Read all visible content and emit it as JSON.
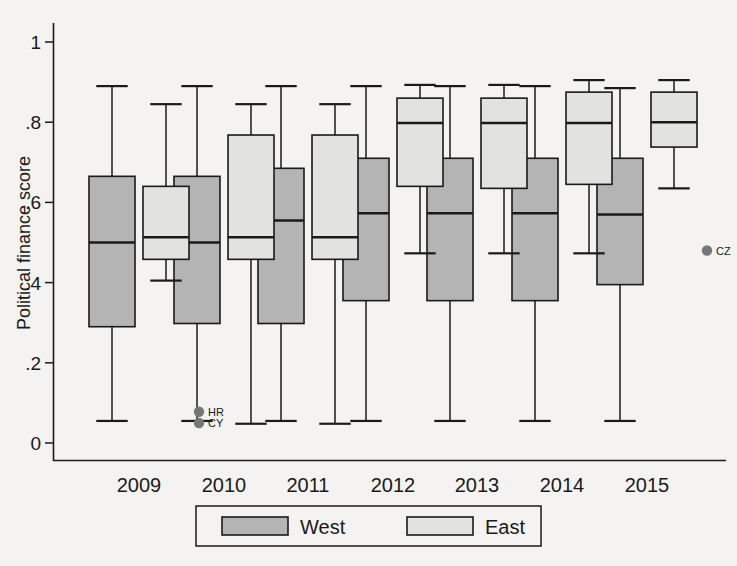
{
  "chart_data": {
    "type": "box",
    "title": "",
    "xlabel": "",
    "ylabel": "Political finance score",
    "categories": [
      "2009",
      "2010",
      "2011",
      "2012",
      "2013",
      "2014",
      "2015"
    ],
    "ylim": [
      0,
      1
    ],
    "yticks": [
      0,
      0.2,
      0.4,
      0.6,
      0.8,
      1
    ],
    "ytick_labels": [
      "0",
      ".2",
      ".4",
      ".6",
      ".8",
      "1"
    ],
    "grid": false,
    "legend_position": "bottom",
    "series": [
      {
        "name": "West",
        "color": "#b4b4b4",
        "boxes": [
          {
            "category": "2009",
            "min": 0.055,
            "q1": 0.29,
            "median": 0.5,
            "q3": 0.665,
            "max": 0.89,
            "outliers": []
          },
          {
            "category": "2010",
            "min": 0.055,
            "q1": 0.298,
            "median": 0.5,
            "q3": 0.665,
            "max": 0.89,
            "outliers": []
          },
          {
            "category": "2011",
            "min": 0.055,
            "q1": 0.298,
            "median": 0.555,
            "q3": 0.685,
            "max": 0.89,
            "outliers": []
          },
          {
            "category": "2012",
            "min": 0.055,
            "q1": 0.355,
            "median": 0.573,
            "q3": 0.71,
            "max": 0.89,
            "outliers": []
          },
          {
            "category": "2013",
            "min": 0.055,
            "q1": 0.355,
            "median": 0.573,
            "q3": 0.71,
            "max": 0.89,
            "outliers": []
          },
          {
            "category": "2014",
            "min": 0.055,
            "q1": 0.355,
            "median": 0.573,
            "q3": 0.71,
            "max": 0.89,
            "outliers": []
          },
          {
            "category": "2015",
            "min": 0.055,
            "q1": 0.395,
            "median": 0.57,
            "q3": 0.71,
            "max": 0.885,
            "outliers": []
          }
        ]
      },
      {
        "name": "East",
        "color": "#e2e2e0",
        "boxes": [
          {
            "category": "2009",
            "min": 0.405,
            "q1": 0.458,
            "median": 0.513,
            "q3": 0.64,
            "max": 0.845,
            "outliers": [
              {
                "label": "HR",
                "value": 0.078
              },
              {
                "label": "CY",
                "value": 0.05
              }
            ]
          },
          {
            "category": "2010",
            "min": 0.048,
            "q1": 0.458,
            "median": 0.513,
            "q3": 0.768,
            "max": 0.845,
            "outliers": []
          },
          {
            "category": "2011",
            "min": 0.048,
            "q1": 0.458,
            "median": 0.513,
            "q3": 0.768,
            "max": 0.845,
            "outliers": []
          },
          {
            "category": "2012",
            "min": 0.473,
            "q1": 0.64,
            "median": 0.798,
            "q3": 0.86,
            "max": 0.893,
            "outliers": []
          },
          {
            "category": "2013",
            "min": 0.473,
            "q1": 0.635,
            "median": 0.798,
            "q3": 0.86,
            "max": 0.893,
            "outliers": []
          },
          {
            "category": "2014",
            "min": 0.473,
            "q1": 0.645,
            "median": 0.798,
            "q3": 0.875,
            "max": 0.905,
            "outliers": []
          },
          {
            "category": "2015",
            "min": 0.635,
            "q1": 0.738,
            "median": 0.8,
            "q3": 0.875,
            "max": 0.905,
            "outliers": [
              {
                "label": "CZ",
                "value": 0.48
              }
            ]
          }
        ]
      }
    ]
  },
  "axis": {
    "y_title": "Political finance score",
    "y_labels": [
      "1",
      ".8",
      ".6",
      ".4",
      ".2",
      "0"
    ],
    "x_labels": [
      "2009",
      "2010",
      "2011",
      "2012",
      "2013",
      "2014",
      "2015"
    ]
  },
  "legend": {
    "entries": [
      {
        "label": "West",
        "color": "#b4b4b4"
      },
      {
        "label": "East",
        "color": "#e2e2e0"
      }
    ]
  },
  "outlier_annotations": [
    {
      "label": "HR",
      "group": "2009",
      "series": "East",
      "value": 0.078
    },
    {
      "label": "CY",
      "group": "2009",
      "series": "East",
      "value": 0.05
    },
    {
      "label": "CZ",
      "group": "2015",
      "series": "East",
      "value": 0.48
    }
  ],
  "colors": {
    "west_fill": "#b4b4b4",
    "east_fill": "#e2e2e0",
    "stroke": "#1a1a1a",
    "background": "#f4f3f1",
    "outlier_marker": "#777777"
  }
}
